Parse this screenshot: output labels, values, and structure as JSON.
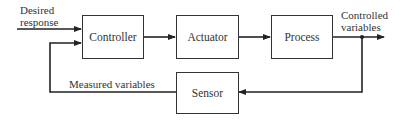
{
  "diagram": {
    "type": "closed-loop control block diagram",
    "blocks": {
      "controller": "Controller",
      "actuator": "Actuator",
      "process": "Process",
      "sensor": "Sensor"
    },
    "labels": {
      "input_line1": "Desired",
      "input_line2": "response",
      "output_line1": "Controlled",
      "output_line2": "variables",
      "feedback": "Measured variables"
    },
    "colors": {
      "line": "#222222",
      "background": "#ffffff"
    }
  }
}
